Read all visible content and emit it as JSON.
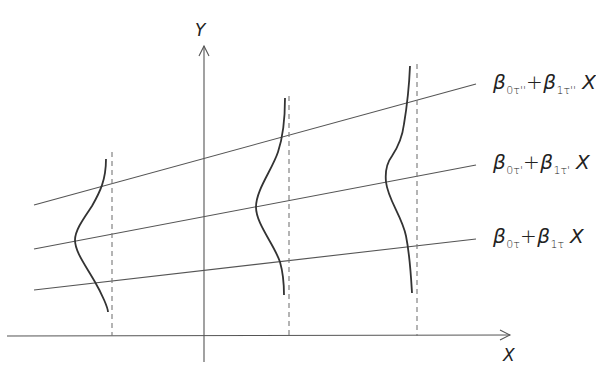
{
  "diagram": {
    "axes": {
      "x_label": "X",
      "y_label": "Y"
    },
    "equations": [
      {
        "id": "line-tau-double-prime",
        "beta": "β",
        "sub0": "0τ''",
        "plus": "+",
        "sub1": "1τ''",
        "x": "X"
      },
      {
        "id": "line-tau-prime",
        "beta": "β",
        "sub0": "0τ'",
        "plus": "+",
        "sub1": "1τ'",
        "x": "X"
      },
      {
        "id": "line-tau",
        "beta": "β",
        "sub0": "0τ",
        "plus": "+",
        "sub1": "1τ",
        "x": "X"
      }
    ],
    "dashed_verticals_x": [
      112,
      289,
      417
    ],
    "colors": {
      "line": "#555555",
      "curve": "#333333",
      "text": "#222222"
    }
  }
}
